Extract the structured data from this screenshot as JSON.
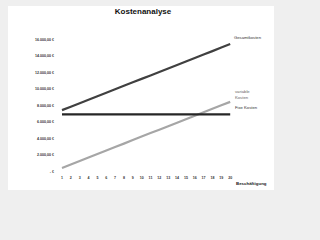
{
  "chart_data": {
    "type": "line",
    "title": "Kostenanalyse",
    "xlabel": "Beschäftigung",
    "ylabel": "",
    "x": [
      1,
      2,
      3,
      4,
      5,
      6,
      7,
      8,
      9,
      10,
      11,
      12,
      13,
      14,
      15,
      16,
      17,
      18,
      19,
      20
    ],
    "ylim": [
      0,
      16000
    ],
    "y_ticks": [
      "- €",
      "2.000,00 €",
      "4.000,00 €",
      "6.000,00 €",
      "8.000,00 €",
      "10.000,00 €",
      "12.000,00 €",
      "14.000,00 €",
      "16.000,00 €"
    ],
    "grid": false,
    "legend_position": "inline-right",
    "series": [
      {
        "name": "Gesamtkosten",
        "color": "#404040",
        "values": [
          7500,
          7921,
          8342,
          8763,
          9184,
          9605,
          10026,
          10447,
          10868,
          11289,
          11711,
          12132,
          12553,
          12974,
          13395,
          13816,
          14237,
          14658,
          15079,
          15500
        ]
      },
      {
        "name": "variable Kosten",
        "color": "#a6a6a6",
        "values": [
          500,
          921,
          1342,
          1763,
          2184,
          2605,
          3026,
          3447,
          3868,
          4289,
          4711,
          5132,
          5553,
          5974,
          6395,
          6816,
          7237,
          7658,
          8079,
          8500
        ]
      },
      {
        "name": "Fixe Kosten",
        "color": "#262626",
        "values": [
          7000,
          7000,
          7000,
          7000,
          7000,
          7000,
          7000,
          7000,
          7000,
          7000,
          7000,
          7000,
          7000,
          7000,
          7000,
          7000,
          7000,
          7000,
          7000,
          7000
        ]
      }
    ]
  },
  "labels": {
    "title": "Kostenanalyse",
    "xaxis": "Beschäftigung",
    "series_gesamt": "Gesamtkosten",
    "series_variable_1": "variable",
    "series_variable_2": "Kosten",
    "series_fix": "Fixe Kosten"
  }
}
